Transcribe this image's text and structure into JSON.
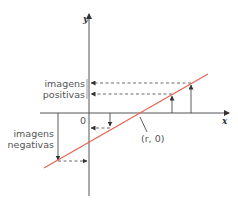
{
  "diagram": {
    "axes": {
      "x_label": "x",
      "y_label": "y",
      "origin_label": "0"
    },
    "root_point_label": "(r, 0)",
    "annotations": {
      "positive_images": [
        "imagens",
        "positivas"
      ],
      "negative_images": [
        "imagens",
        "negativas"
      ]
    },
    "colors": {
      "line": "#e8604c",
      "axis": "#555555",
      "text": "#555555"
    }
  }
}
